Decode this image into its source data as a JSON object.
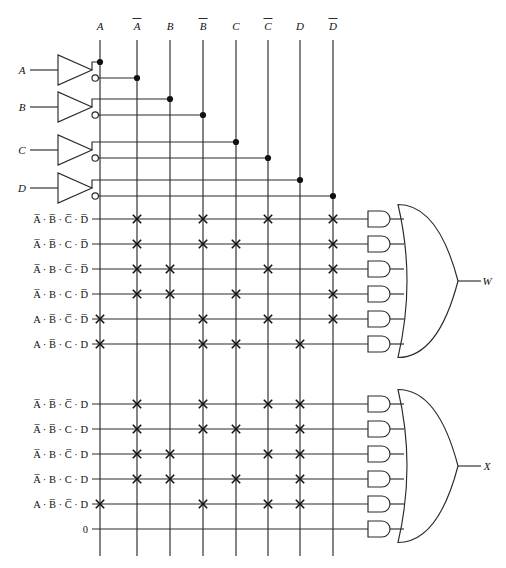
{
  "diagram": {
    "type": "pla-logic-diagram",
    "columns": [
      {
        "id": "A",
        "label": "A",
        "overbar": false,
        "x": 100
      },
      {
        "id": "nA",
        "label": "A",
        "overbar": true,
        "x": 137
      },
      {
        "id": "B",
        "label": "B",
        "overbar": false,
        "x": 170
      },
      {
        "id": "nB",
        "label": "B",
        "overbar": true,
        "x": 203
      },
      {
        "id": "C",
        "label": "C",
        "overbar": false,
        "x": 236
      },
      {
        "id": "nC",
        "label": "C",
        "overbar": true,
        "x": 268
      },
      {
        "id": "D",
        "label": "D",
        "overbar": false,
        "x": 300
      },
      {
        "id": "nD",
        "label": "D",
        "overbar": true,
        "x": 333
      }
    ],
    "column_header_labels": [
      "A",
      "A̅",
      "B",
      "B̅",
      "C",
      "C̅",
      "D",
      "D̅"
    ],
    "inputs": [
      {
        "label": "A",
        "y": 70,
        "true_col": "A",
        "true_y": 62,
        "comp_col": "nA",
        "comp_y": 78
      },
      {
        "label": "B",
        "y": 107,
        "true_col": "B",
        "true_y": 99,
        "comp_col": "nB",
        "comp_y": 115
      },
      {
        "label": "C",
        "y": 150,
        "true_col": "C",
        "true_y": 142,
        "comp_col": "nC",
        "comp_y": 158
      },
      {
        "label": "D",
        "y": 188,
        "true_col": "D",
        "true_y": 180,
        "comp_col": "nD",
        "comp_y": 196
      }
    ],
    "product_terms": [
      {
        "index": 0,
        "y": 219,
        "group": "W",
        "text": "A̅ · B̅ · C̅ · D̅",
        "connections": [
          "nA",
          "nB",
          "nC",
          "nD"
        ]
      },
      {
        "index": 1,
        "y": 244,
        "group": "W",
        "text": "A̅ · B̅ · C · D̅",
        "connections": [
          "nA",
          "nB",
          "C",
          "nD"
        ]
      },
      {
        "index": 2,
        "y": 269,
        "group": "W",
        "text": "A̅ · B · C̅ · D̅",
        "connections": [
          "nA",
          "B",
          "nC",
          "nD"
        ]
      },
      {
        "index": 3,
        "y": 294,
        "group": "W",
        "text": "A̅ · B · C · D̅",
        "connections": [
          "nA",
          "B",
          "C",
          "nD"
        ]
      },
      {
        "index": 4,
        "y": 319,
        "group": "W",
        "text": "A · B̅ · C̅ · D̅",
        "connections": [
          "A",
          "nB",
          "nC",
          "nD"
        ]
      },
      {
        "index": 5,
        "y": 344,
        "group": "W",
        "text": "A · B̅ · C · D",
        "connections": [
          "A",
          "nB",
          "C",
          "D"
        ]
      },
      {
        "index": 6,
        "y": 404,
        "group": "X",
        "text": "A̅ · B̅ · C̅ · D",
        "connections": [
          "nA",
          "nB",
          "nC",
          "D"
        ]
      },
      {
        "index": 7,
        "y": 429,
        "group": "X",
        "text": "A̅ · B̅ · C · D",
        "connections": [
          "nA",
          "nB",
          "C",
          "D"
        ]
      },
      {
        "index": 8,
        "y": 454,
        "group": "X",
        "text": "A̅ · B · C̅ · D",
        "connections": [
          "nA",
          "B",
          "nC",
          "D"
        ]
      },
      {
        "index": 9,
        "y": 479,
        "group": "X",
        "text": "A̅ · B · C · D",
        "connections": [
          "nA",
          "B",
          "C",
          "D"
        ]
      },
      {
        "index": 10,
        "y": 504,
        "group": "X",
        "text": "A · B̅ · C̅ · D",
        "connections": [
          "A",
          "nB",
          "nC",
          "D"
        ]
      },
      {
        "index": 11,
        "y": 529,
        "group": "X",
        "text": "0",
        "connections": []
      }
    ],
    "outputs": [
      {
        "label": "W",
        "y": 281,
        "x": 487,
        "group": "W"
      },
      {
        "label": "X",
        "y": 466,
        "x": 487,
        "group": "X"
      }
    ],
    "and_gate_count": 12,
    "or_gate_count": 2,
    "inverter_count": 4,
    "notes": {
      "xmark_meaning": "programmed crosspoint connection",
      "dot_meaning": "wire junction / tap"
    }
  },
  "colors": {
    "background": "#ffffff",
    "wire": "#2a2a2a",
    "dot": "#111111",
    "text": "#111111"
  }
}
